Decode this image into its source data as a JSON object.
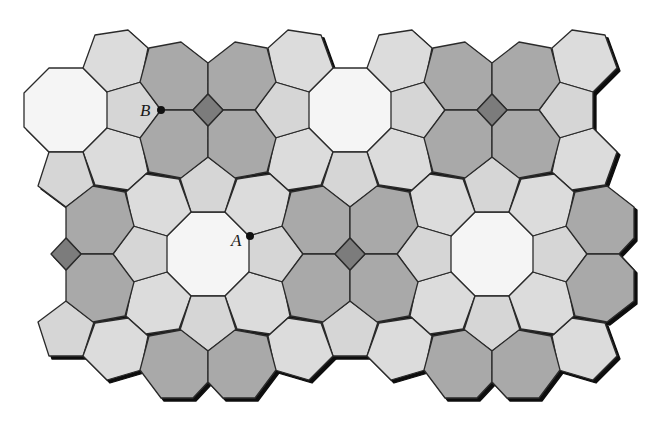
{
  "figure": {
    "type": "tiling",
    "colors": {
      "square": "#7b7b7b",
      "heptagon": "#a9a9a9",
      "pentagon": "#d6d6d6",
      "hexagon": "#dcdcdc",
      "octagon": "#f5f5f5",
      "stroke": "#2b2b2b",
      "shadow": "#111111"
    },
    "points": [
      {
        "label": "A",
        "x": 250,
        "y": 236,
        "label_x": 231,
        "label_y": 246
      },
      {
        "label": "B",
        "x": 161,
        "y": 110,
        "label_x": 140,
        "label_y": 116
      }
    ],
    "shapes": {
      "square": [
        [
          -15,
          0
        ],
        [
          0,
          -16
        ],
        [
          15,
          0
        ],
        [
          0,
          16
        ]
      ],
      "heptagon_ul": [
        [
          -15,
          0
        ],
        [
          0,
          -16
        ],
        [
          0,
          -47
        ],
        [
          -27,
          -68
        ],
        [
          -59,
          -62
        ],
        [
          -68,
          -28
        ],
        [
          -47,
          0
        ]
      ],
      "pentagon_l": [
        [
          -101,
          -18
        ],
        [
          -67,
          -28
        ],
        [
          -47,
          0
        ],
        [
          -67,
          28
        ],
        [
          -101,
          18
        ]
      ],
      "pentagon_b": [
        [
          -17,
          102
        ],
        [
          17,
          102
        ],
        [
          28,
          68
        ],
        [
          0,
          47
        ],
        [
          -28,
          68
        ]
      ],
      "hexagon_ul": [
        [
          -113,
          -75
        ],
        [
          -80,
          -80
        ],
        [
          -60,
          -62
        ],
        [
          -67,
          -28
        ],
        [
          -101,
          -18
        ],
        [
          -125,
          -42
        ]
      ],
      "octagon": [
        [
          -17,
          -42
        ],
        [
          17,
          -42
        ],
        [
          42,
          -17
        ],
        [
          42,
          17
        ],
        [
          17,
          42
        ],
        [
          -17,
          42
        ],
        [
          -42,
          17
        ],
        [
          -42,
          -17
        ]
      ]
    },
    "clusters": [
      {
        "cx": 208,
        "cy": 110,
        "square": true,
        "hept": [
          "ul",
          "ur",
          "ll",
          "lr"
        ],
        "pent": [
          "l",
          "r",
          "b"
        ],
        "hex": [
          "ul",
          "ur",
          "ll",
          "lr"
        ]
      },
      {
        "cx": 492,
        "cy": 110,
        "square": true,
        "hept": [
          "ul",
          "ur",
          "ll",
          "lr"
        ],
        "pent": [
          "l",
          "r",
          "b"
        ],
        "hex": [
          "ul",
          "ur",
          "ll",
          "lr"
        ]
      },
      {
        "cx": 350,
        "cy": 254,
        "square": true,
        "hept": [
          "ul",
          "ur",
          "ll",
          "lr"
        ],
        "pent": [
          "t",
          "l",
          "r",
          "b"
        ],
        "hex": [
          "ul",
          "ur",
          "ll",
          "lr"
        ]
      },
      {
        "cx": 66,
        "cy": 254,
        "square": true,
        "hept": [
          "ur",
          "lr"
        ],
        "pent": [
          "t",
          "r",
          "b"
        ],
        "hex": [
          "ur",
          "lr"
        ]
      },
      {
        "cx": 208,
        "cy": 398,
        "square": false,
        "hept": [
          "ul",
          "ur"
        ],
        "pent": [
          "t"
        ],
        "hex": [
          "ul",
          "ur"
        ]
      },
      {
        "cx": 492,
        "cy": 398,
        "square": false,
        "hept": [
          "ul",
          "ur"
        ],
        "pent": [
          "t"
        ],
        "hex": [
          "ul",
          "ur"
        ]
      },
      {
        "cx": 634,
        "cy": 254,
        "square": false,
        "hept": [
          "ul",
          "ll"
        ],
        "pent": [
          "l"
        ],
        "hex": [
          "ul",
          "ll"
        ]
      }
    ],
    "octagons": [
      {
        "cx": 66,
        "cy": 110
      },
      {
        "cx": 350,
        "cy": 110
      },
      {
        "cx": 208,
        "cy": 254
      },
      {
        "cx": 492,
        "cy": 254
      }
    ]
  }
}
